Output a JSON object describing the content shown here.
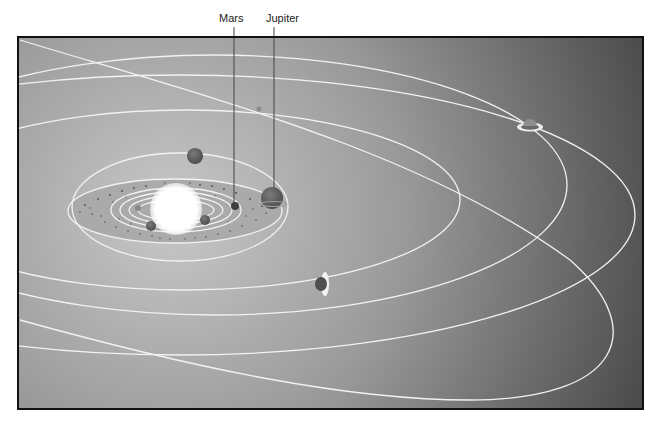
{
  "diagram": {
    "type": "solar-system-illustration",
    "labels": [
      {
        "id": "mars",
        "text": "Mars"
      },
      {
        "id": "jupiter",
        "text": "Jupiter"
      }
    ],
    "colors": {
      "bg_light": "#c2c2c2",
      "bg_dark": "#4a4a4a",
      "orbit": "#f2f2f2",
      "sun": "#ffffff",
      "planet": "#585858",
      "frame": "#111111"
    }
  }
}
